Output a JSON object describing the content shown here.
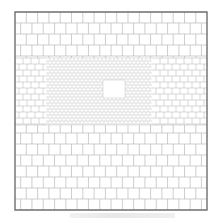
{
  "figure": {
    "frame": {
      "x": 15,
      "y": 12,
      "width": 192,
      "height": 198,
      "stroke": "#6e6e6e"
    },
    "grid_color": "#b9b9b9",
    "regions": [
      {
        "name": "coarse",
        "brick_w": 11.3,
        "brick_h": 11,
        "x": 15,
        "y": 12,
        "w": 192,
        "h": 198
      },
      {
        "name": "medium-left",
        "brick_w": 8,
        "brick_h": 6,
        "x": 15,
        "y": 58,
        "w": 31,
        "h": 67
      },
      {
        "name": "medium-right",
        "brick_w": 8,
        "brick_h": 6,
        "x": 152,
        "y": 58,
        "w": 55,
        "h": 67
      },
      {
        "name": "fine",
        "brick_w": 4,
        "brick_h": 3,
        "x": 46,
        "y": 58,
        "w": 106,
        "h": 67
      }
    ],
    "opening": {
      "x": 103,
      "y": 80,
      "width": 22,
      "height": 18
    },
    "caption_text": ""
  }
}
